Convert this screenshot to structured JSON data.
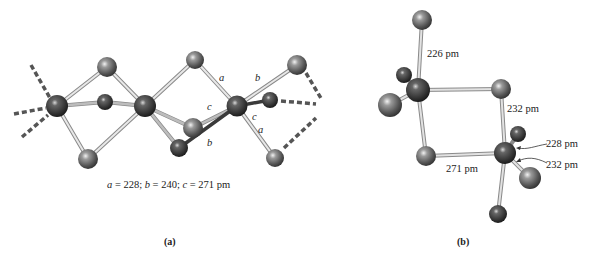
{
  "panel_a": {
    "label": "(a)",
    "bond_labels": [
      "a",
      "b",
      "c",
      "c",
      "a",
      "b"
    ],
    "caption": "a = 228; b = 240; c = 271 pm",
    "caption_parts": {
      "a_sym": "a",
      "a_val": " = 228; ",
      "b_sym": "b",
      "b_val": " = 240; ",
      "c_sym": "c",
      "c_val": " = 271 pm"
    }
  },
  "panel_b": {
    "label": "(b)",
    "distances": {
      "top_bond": "226 pm",
      "right_bond": "232 pm",
      "bottom_bond": "271 pm",
      "arrow_upper": "228 pm",
      "arrow_lower": "232 pm"
    }
  },
  "colors": {
    "atom_light": "#c8c8c8",
    "atom_mid": "#6e6e6e",
    "atom_dark": "#2a2a2a",
    "bond_light": "#d6d6d6",
    "bond_edge": "#8a8a8a",
    "dashed": "#555555"
  }
}
